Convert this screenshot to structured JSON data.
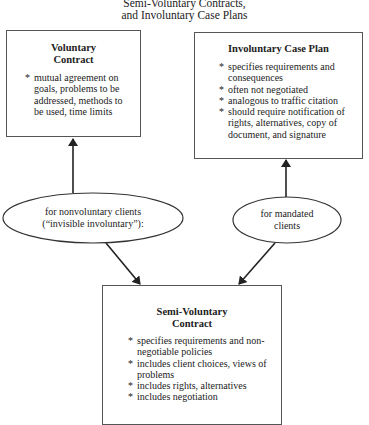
{
  "title": {
    "line1": "Semi-Voluntary Contracts,",
    "line2": "and Involuntary Case Plans"
  },
  "boxes": {
    "voluntary": {
      "title_line1": "Voluntary",
      "title_line2": "Contract",
      "bullets": [
        "mutual agreement on goals, problems to be addressed, methods to be used, time limits"
      ]
    },
    "involuntary": {
      "title": "Involuntary Case Plan",
      "bullets": [
        "specifies requirements and consequences",
        "often not negotiated",
        "analogous to traffic citation",
        "should require notification of rights, alternatives, copy of document, and signature"
      ]
    },
    "semi_voluntary": {
      "title_line1": "Semi-Voluntary",
      "title_line2": "Contract",
      "bullets": [
        "specifies requirements and non-negotiable policies",
        "includes client choices, views of problems",
        "includes rights, alternatives",
        "includes negotiation"
      ]
    }
  },
  "ellipses": {
    "nonvoluntary": {
      "line1": "for nonvoluntary clients",
      "line2": "(“invisible involuntary”):"
    },
    "mandated": {
      "line1": "for mandated",
      "line2": "clients"
    }
  },
  "colors": {
    "line": "#222222",
    "border": "#555555",
    "background": "#ffffff"
  }
}
